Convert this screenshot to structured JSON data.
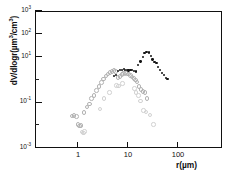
{
  "chart_data": {
    "type": "scatter",
    "title": "",
    "xlabel": "r(µm)",
    "ylabel": "dV/dlogr(µm³/cm³)",
    "xscale": "log",
    "yscale": "log",
    "xlim": [
      0.4,
      600
    ],
    "ylim": [
      0.001,
      1000
    ],
    "grid": false,
    "legend": "none",
    "xticks": [
      1,
      10,
      100
    ],
    "xticklabels": [
      "1",
      "10",
      "100"
    ],
    "yticks": [
      0.001,
      0.01,
      0.1,
      1,
      10,
      100,
      1000
    ],
    "yticklabels": [
      "10",
      "10",
      "10",
      "10",
      "10",
      "10",
      "10"
    ],
    "yexponents": [
      "-3",
      "-2",
      "-1",
      "0",
      "1",
      "2",
      "3"
    ],
    "ylabeled_indices": [
      0,
      2,
      4,
      5,
      6
    ],
    "series": [
      {
        "name": "open-circles",
        "marker": "open circle",
        "color": "#b2b2b2",
        "points": [
          [
            0.72,
            0.028
          ],
          [
            0.8,
            0.03
          ],
          [
            0.88,
            0.026
          ],
          [
            0.95,
            0.012
          ],
          [
            1.02,
            0.01
          ],
          [
            1.1,
            0.011
          ],
          [
            1.25,
            0.04
          ],
          [
            1.45,
            0.07
          ],
          [
            1.62,
            0.095
          ],
          [
            1.8,
            0.16
          ],
          [
            2.0,
            0.22
          ],
          [
            2.25,
            0.36
          ],
          [
            2.5,
            0.55
          ],
          [
            2.8,
            0.8
          ],
          [
            3.1,
            1.15
          ],
          [
            3.45,
            1.55
          ],
          [
            3.8,
            1.9
          ],
          [
            4.2,
            2.3
          ],
          [
            4.6,
            2.55
          ],
          [
            5.0,
            2.7
          ],
          [
            5.4,
            2.5
          ],
          [
            6.0,
            1.35
          ],
          [
            6.6,
            1.5
          ],
          [
            7.2,
            1.8
          ],
          [
            7.8,
            2.0
          ],
          [
            8.4,
            2.2
          ],
          [
            9.0,
            2.05
          ],
          [
            9.8,
            1.95
          ],
          [
            10.6,
            1.7
          ],
          [
            11.5,
            1.45
          ],
          [
            12.5,
            1.25
          ],
          [
            13.5,
            1.05
          ],
          [
            14.5,
            0.85
          ],
          [
            16.0,
            0.55
          ],
          [
            17.5,
            0.4
          ],
          [
            19.0,
            0.33
          ],
          [
            21.0,
            0.3
          ],
          [
            23.0,
            0.16
          ]
        ]
      },
      {
        "name": "solid-dots",
        "marker": "filled circle",
        "color": "#141414",
        "points": [
          [
            5.2,
            1.45
          ],
          [
            5.8,
            1.55
          ],
          [
            6.4,
            2.3
          ],
          [
            7.0,
            2.55
          ],
          [
            7.6,
            2.65
          ],
          [
            8.2,
            2.8
          ],
          [
            8.8,
            2.7
          ],
          [
            9.5,
            2.55
          ],
          [
            10.3,
            2.45
          ],
          [
            11.2,
            2.6
          ],
          [
            12.2,
            2.55
          ],
          [
            13.2,
            2.4
          ],
          [
            14.5,
            2.25
          ],
          [
            16.0,
            4.3
          ],
          [
            17.8,
            6.2
          ],
          [
            19.8,
            9.5
          ],
          [
            21.5,
            14.0
          ],
          [
            23.5,
            15.5
          ],
          [
            26.0,
            15.0
          ],
          [
            28.5,
            10.5
          ],
          [
            31.0,
            7.5
          ],
          [
            34.0,
            6.0
          ],
          [
            37.0,
            5.2
          ],
          [
            40.0,
            3.6
          ],
          [
            44.0,
            2.6
          ],
          [
            48.0,
            1.9
          ],
          [
            52.0,
            1.55
          ],
          [
            57.0,
            1.2
          ],
          [
            62.0,
            1.05
          ]
        ]
      },
      {
        "name": "faint-low-points",
        "marker": "open circle faint",
        "color": "#d2d2d2",
        "points": [
          [
            1.15,
            0.0055
          ],
          [
            1.22,
            0.005
          ],
          [
            1.3,
            0.0058
          ],
          [
            2.6,
            0.055
          ],
          [
            3.2,
            0.16
          ],
          [
            4.1,
            0.3
          ],
          [
            5.6,
            0.6
          ],
          [
            6.2,
            0.58
          ],
          [
            7.4,
            0.75
          ],
          [
            13.0,
            0.45
          ],
          [
            14.0,
            0.3
          ],
          [
            15.5,
            0.22
          ],
          [
            17.0,
            0.13
          ],
          [
            19.5,
            0.048
          ],
          [
            22.0,
            0.042
          ],
          [
            26.0,
            0.03
          ],
          [
            31.0,
            0.012
          ]
        ]
      }
    ]
  }
}
